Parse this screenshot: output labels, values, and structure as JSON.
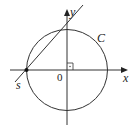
{
  "diagram": {
    "type": "geometry",
    "colors": {
      "stroke": "#333333",
      "text": "#222222",
      "background": "#ffffff"
    },
    "axes": {
      "x_label": "x",
      "y_label": "y",
      "origin_label": "0"
    },
    "circle": {
      "label": "C",
      "center": [
        67,
        70
      ],
      "radius": 40
    },
    "line": {
      "label": "s",
      "from": [
        15,
        82
      ],
      "to": [
        83,
        5
      ],
      "intersection_point": [
        26,
        70
      ]
    },
    "right_angle_marker": true
  }
}
